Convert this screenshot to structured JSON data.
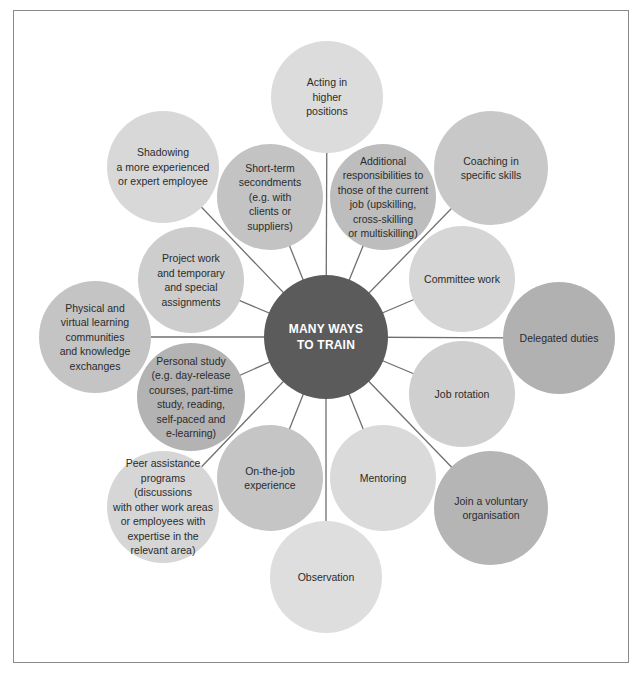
{
  "diagram": {
    "title": "MANY WAYS\nTO TRAIN",
    "center": {
      "x": 326,
      "y": 337,
      "r": 62,
      "color": "#5b5b5b"
    },
    "line_color": "#6f6f6f",
    "nodes": [
      {
        "id": "acting",
        "label": "Acting in\nhigher\npositions",
        "x": 327,
        "y": 97,
        "r": 56,
        "color": "#dcdcdc"
      },
      {
        "id": "additional",
        "label": "Additional\nresponsibilities to\nthose of the current\njob (upskilling,\ncross-skilling\nor multiskilling)",
        "x": 383,
        "y": 197,
        "r": 53,
        "color": "#bdbdbd"
      },
      {
        "id": "coaching",
        "label": "Coaching in\nspecific skills",
        "x": 491,
        "y": 168,
        "r": 57,
        "color": "#c8c8c8"
      },
      {
        "id": "committee",
        "label": "Committee work",
        "x": 462,
        "y": 279,
        "r": 53,
        "color": "#d6d6d6"
      },
      {
        "id": "delegated",
        "label": "Delegated duties",
        "x": 559,
        "y": 338,
        "r": 56,
        "color": "#b1b1b1"
      },
      {
        "id": "job-rotation",
        "label": "Job rotation",
        "x": 462,
        "y": 394,
        "r": 53,
        "color": "#cfcfcf"
      },
      {
        "id": "voluntary",
        "label": "Join a voluntary\norganisation",
        "x": 491,
        "y": 508,
        "r": 57,
        "color": "#b5b5b5"
      },
      {
        "id": "mentoring",
        "label": "Mentoring",
        "x": 383,
        "y": 478,
        "r": 53,
        "color": "#dadada"
      },
      {
        "id": "observation",
        "label": "Observation",
        "x": 326,
        "y": 577,
        "r": 56,
        "color": "#dedede"
      },
      {
        "id": "on-the-job",
        "label": "On-the-job\nexperience",
        "x": 270,
        "y": 478,
        "r": 53,
        "color": "#c5c5c5"
      },
      {
        "id": "peer",
        "label": "Peer assistance\nprograms (discussions\nwith other work areas\nor employees with\nexpertise in the\nrelevant area)",
        "x": 163,
        "y": 507,
        "r": 56,
        "color": "#d6d6d6"
      },
      {
        "id": "personal-study",
        "label": "Personal study\n(e.g. day-release\ncourses, part-time\nstudy, reading,\nself-paced and\ne-learning)",
        "x": 191,
        "y": 397,
        "r": 54,
        "color": "#b3b3b3"
      },
      {
        "id": "physical",
        "label": "Physical and\nvirtual learning\ncommunities\nand knowledge\nexchanges",
        "x": 95,
        "y": 337,
        "r": 56,
        "color": "#c4c4c4"
      },
      {
        "id": "project",
        "label": "Project work\nand temporary\nand special\nassignments",
        "x": 191,
        "y": 280,
        "r": 53,
        "color": "#cdcdcd"
      },
      {
        "id": "shadowing",
        "label": "Shadowing\na more experienced\nor expert employee",
        "x": 163,
        "y": 167,
        "r": 56,
        "color": "#d8d8d8"
      },
      {
        "id": "short-term",
        "label": "Short-term\nsecondments\n(e.g. with\nclients or\nsuppliers)",
        "x": 270,
        "y": 197,
        "r": 53,
        "color": "#c3c3c3"
      }
    ]
  }
}
